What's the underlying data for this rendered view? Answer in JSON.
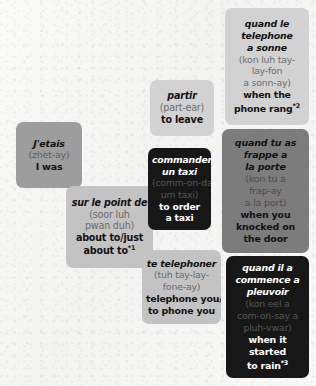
{
  "page": {
    "background_color": "#f6f6f5"
  },
  "palette": {
    "xlight_gray": "#d2d2d2",
    "light_gray": "#c3c3c3",
    "mid_gray": "#9d9d9d",
    "dark_gray": "#7c7c7c",
    "black": "#171717",
    "text_dark": "#121212",
    "text_white": "#ffffff"
  },
  "cards": [
    {
      "id": "jetais",
      "tone": "mid",
      "french": [
        "J'etais"
      ],
      "phonetic": [
        "(zhet-ay)"
      ],
      "english": [
        "I was"
      ],
      "footnote": ""
    },
    {
      "id": "surlepoint",
      "tone": "light",
      "french": [
        "sur le point de"
      ],
      "phonetic": [
        "(soor luh",
        "pwan duh)"
      ],
      "english": [
        "about to/just",
        "about to"
      ],
      "footnote": "*1"
    },
    {
      "id": "partir",
      "tone": "xlight",
      "french": [
        "partir"
      ],
      "phonetic": [
        "(part-ear)"
      ],
      "english": [
        "to leave"
      ],
      "footnote": ""
    },
    {
      "id": "commander",
      "tone": "black",
      "french": [
        "commander",
        "un taxi"
      ],
      "phonetic": [
        "(comm-on-day",
        "um taxi)"
      ],
      "english": [
        "to order",
        "a taxi"
      ],
      "footnote": ""
    },
    {
      "id": "tetelephoner",
      "tone": "light",
      "french": [
        "te telephoner"
      ],
      "phonetic": [
        "(tuh tay-lay-",
        "fone-ay)"
      ],
      "english": [
        "telephone you/",
        "to phone you"
      ],
      "footnote": ""
    },
    {
      "id": "quandletelephone",
      "tone": "xlight",
      "french": [
        "quand le",
        "telephone",
        "a sonne"
      ],
      "phonetic": [
        "(kon luh tay-",
        "lay-fon",
        "a sonn-ay)"
      ],
      "english": [
        "when the",
        "phone rang"
      ],
      "footnote": "*2"
    },
    {
      "id": "quandtuas",
      "tone": "dark",
      "french": [
        "quand tu as",
        "frappe a",
        "la porte"
      ],
      "phonetic": [
        "(kon tu a",
        "frap-ay",
        "a la port)"
      ],
      "english": [
        "when you",
        "knocked on",
        "the door"
      ],
      "footnote": ""
    },
    {
      "id": "quandila",
      "tone": "black",
      "french": [
        "quand il a",
        "commence a",
        "pleuvoir"
      ],
      "phonetic": [
        "(kon eel a",
        "com-on-say a",
        "pluh-vwar)"
      ],
      "english": [
        "when it",
        "started",
        "to rain"
      ],
      "footnote": "*3"
    }
  ]
}
